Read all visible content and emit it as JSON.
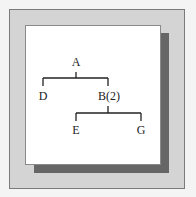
{
  "diagram": {
    "type": "tree",
    "nodes": {
      "root": "A",
      "left1": "D",
      "right1": "B(2)",
      "left2": "E",
      "right2": "G"
    },
    "edges": [
      [
        "A",
        "D"
      ],
      [
        "A",
        "B(2)"
      ],
      [
        "B(2)",
        "E"
      ],
      [
        "B(2)",
        "G"
      ]
    ],
    "colors": {
      "frame": "#d4d4d4",
      "shadow": "#666666",
      "panel": "#ffffff",
      "lines": "#222222"
    }
  }
}
